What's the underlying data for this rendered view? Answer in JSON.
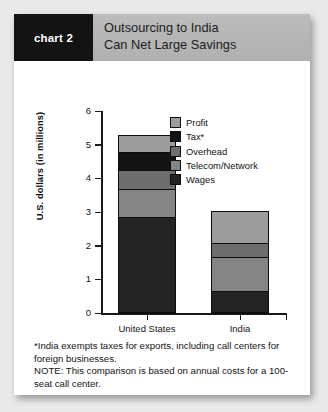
{
  "header": {
    "tag": "chart 2",
    "title_line1": "Outsourcing to India",
    "title_line2": "Can Net Large Savings"
  },
  "notes": {
    "footnote": "*India exempts taxes for exports, including call centers for foreign businesses.",
    "note": "NOTE: This comparison is based on annual costs for a 100-seat call center."
  },
  "colors": {
    "profit": "#9d9d9d",
    "tax": "#131313",
    "overhead": "#6e6e6e",
    "telecom": "#858585",
    "wages": "#242424",
    "tag_background": "#131313",
    "header_background": "#b4b4b4",
    "page_background": "#e9e9e9",
    "card_background": "#ffffff",
    "axis": "#1a1a1a"
  },
  "chart_data": {
    "type": "bar",
    "subtype": "stacked",
    "title": "Outsourcing to India Can Net Large Savings",
    "xlabel": "",
    "ylabel": "U.S. dollars (in millions)",
    "ylim": [
      0,
      6
    ],
    "yticks": [
      0,
      1,
      2,
      3,
      4,
      5,
      6
    ],
    "ytick_labels": [
      "0",
      "1",
      "2",
      "3",
      "4",
      "5",
      "6"
    ],
    "grid": false,
    "legend_position": "inside-top-right",
    "categories": [
      "United States",
      "India"
    ],
    "series": [
      {
        "name": "Wages",
        "values": [
          2.83,
          0.63
        ],
        "color": "#242424"
      },
      {
        "name": "Telecom/Network",
        "values": [
          0.84,
          1.02
        ],
        "color": "#858585"
      },
      {
        "name": "Overhead",
        "values": [
          0.55,
          0.4
        ],
        "color": "#6e6e6e"
      },
      {
        "name": "Tax*",
        "values": [
          0.56,
          0.0
        ],
        "color": "#131313"
      },
      {
        "name": "Profit",
        "values": [
          0.5,
          0.95
        ],
        "color": "#9d9d9d"
      }
    ],
    "totals": [
      5.28,
      3.0
    ],
    "legend_order": [
      "Profit",
      "Tax*",
      "Overhead",
      "Telecom/Network",
      "Wages"
    ],
    "annotations": [
      "*India exempts taxes for exports, including call centers for foreign businesses.",
      "NOTE: This comparison is based on annual costs for a 100-seat call center."
    ]
  }
}
